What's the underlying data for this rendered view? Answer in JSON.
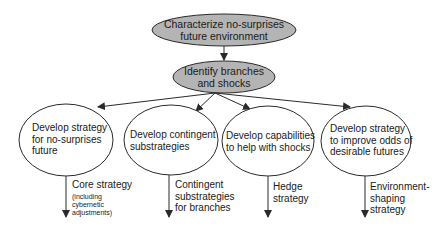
{
  "diagram": {
    "colors": {
      "top_fill": "#b4b4b4",
      "stroke": "#2a2a2a",
      "text": "#1a1a1a",
      "background": "#ffffff"
    },
    "top_node": {
      "label": "Characterize no-surprises\nfuture environment"
    },
    "middle_node": {
      "label": "Identify branches\nand shocks"
    },
    "branches": [
      {
        "node_label": "Develop strategy\nfor no-surprises\nfuture",
        "output_label": "Core strategy",
        "output_note": "(including\ncybernetic\nadjustments)"
      },
      {
        "node_label": "Develop contingent\nsubstrategies",
        "output_label": "Contingent\nsubstrategies\nfor branches",
        "output_note": ""
      },
      {
        "node_label": "Develop capabilities\nto help with shocks",
        "output_label": "Hedge\nstrategy",
        "output_note": ""
      },
      {
        "node_label": "Develop strategy\nto improve odds of\ndesirable futures",
        "output_label": "Environment-\nshaping\nstrategy",
        "output_note": ""
      }
    ]
  }
}
